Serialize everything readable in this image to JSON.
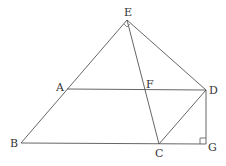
{
  "diagram": {
    "type": "geometry",
    "points": {
      "E": {
        "label": "E",
        "x": 127,
        "y": 20,
        "lx": 124,
        "ly": 16
      },
      "A": {
        "label": "A",
        "x": 67,
        "y": 89,
        "lx": 56,
        "ly": 91
      },
      "F": {
        "label": "F",
        "x": 146,
        "y": 89,
        "lx": 146,
        "ly": 88
      },
      "D": {
        "label": "D",
        "x": 206,
        "y": 90,
        "lx": 209,
        "ly": 94
      },
      "B": {
        "label": "B",
        "x": 21,
        "y": 143,
        "lx": 10,
        "ly": 147
      },
      "C": {
        "label": "C",
        "x": 159,
        "y": 144,
        "lx": 155,
        "ly": 157
      },
      "G": {
        "label": "G",
        "x": 206,
        "y": 144,
        "lx": 208,
        "ly": 151
      }
    },
    "segments": [
      [
        "E",
        "B"
      ],
      [
        "E",
        "D"
      ],
      [
        "E",
        "C"
      ],
      [
        "A",
        "D"
      ],
      [
        "B",
        "G"
      ],
      [
        "C",
        "D"
      ],
      [
        "D",
        "G"
      ]
    ],
    "right_angle_marks": [
      "G",
      "E"
    ],
    "colors": {
      "stroke": "#555555",
      "text": "#333333",
      "background": "#ffffff"
    }
  }
}
